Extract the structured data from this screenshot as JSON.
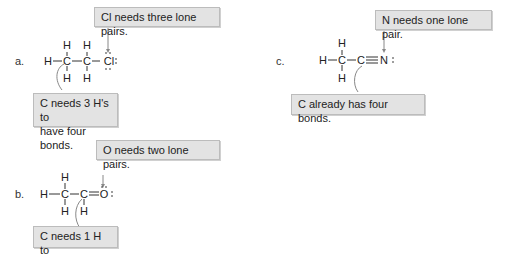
{
  "problems": [
    {
      "label": "a.",
      "molecule": "CH3CH2Cl",
      "atoms": {
        "h_left": "H",
        "c1": "C",
        "c2": "C",
        "x": "Cl",
        "h_top1": "H",
        "h_top2": "H",
        "h_bot1": "H",
        "h_bot2": "H"
      },
      "callouts": {
        "top": "Cl needs three lone pairs.",
        "bottom_line1": "C needs 3 H's to",
        "bottom_line2": "have four bonds."
      }
    },
    {
      "label": "b.",
      "molecule": "CH3CHO",
      "atoms": {
        "h_left": "H",
        "c1": "C",
        "c2": "C",
        "x": "O",
        "h_top1": "H",
        "h_bot1": "H",
        "h_bot2": "H"
      },
      "callouts": {
        "top": "O needs two lone pairs.",
        "bottom_line1": "C needs 1 H to"
      }
    },
    {
      "label": "c.",
      "molecule": "CH3CN",
      "atoms": {
        "h_left": "H",
        "c1": "C",
        "c2": "C",
        "x": "N",
        "h_top1": "H",
        "h_bot1": "H"
      },
      "callouts": {
        "top": "N needs one lone pair.",
        "bottom": "C already has four bonds."
      }
    }
  ],
  "colors": {
    "callout_bg": "#e3e3e3",
    "callout_border": "#bcbcbc",
    "bond": "#333333",
    "arrow": "#888888"
  }
}
